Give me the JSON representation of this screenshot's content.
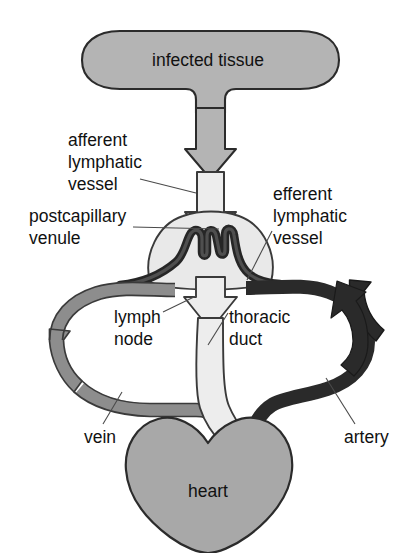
{
  "diagram": {
    "background_color": "#ffffff",
    "labels": {
      "infected_tissue": "infected tissue",
      "afferent_line1": "afferent",
      "afferent_line2": "lymphatic",
      "afferent_line3": "vessel",
      "efferent_line1": "efferent",
      "efferent_line2": "lymphatic",
      "efferent_line3": "vessel",
      "postcapillary_line1": "postcapillary",
      "postcapillary_line2": "venule",
      "lymph_node_line1": "lymph",
      "lymph_node_line2": "node",
      "thoracic_duct_line1": "thoracic",
      "thoracic_duct_line2": "duct",
      "vein": "vein",
      "artery": "artery",
      "heart": "heart"
    },
    "colors": {
      "infected_tissue_fill": "#b4b4b4",
      "infected_tissue_stroke": "#2b2b2b",
      "lymph_node_fill": "#e9e9e9",
      "lymph_node_stroke": "#3a3a3a",
      "lymph_vessel_fill": "#ededed",
      "lymph_vessel_stroke": "#3a3a3a",
      "vein_fill": "#8d8d8d",
      "vein_stroke": "#3a3a3a",
      "artery_fill": "#2a2a2a",
      "artery_stroke": "#1a1a1a",
      "venule_fill": "#262626",
      "heart_fill": "#a8a8a8",
      "heart_stroke": "#2b2b2b",
      "text_color": "#111111",
      "leader_line_color": "#4a4a4a"
    }
  }
}
